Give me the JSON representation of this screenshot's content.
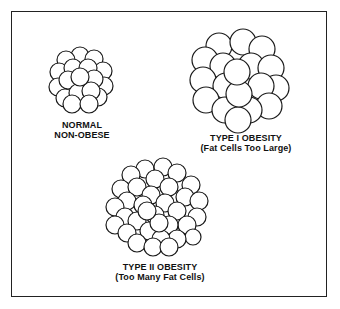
{
  "figure": {
    "panels": [
      {
        "id": "normal",
        "title": "NORMAL",
        "subtitle": "NON-OBESE",
        "cell_description": "small cluster of normal-size fat cells",
        "cell_radius": 9,
        "approx_cell_count": 22
      },
      {
        "id": "type1",
        "title": "TYPE I OBESITY",
        "subtitle": "(Fat Cells Too Large)",
        "cell_description": "cluster of enlarged fat cells",
        "cell_radius": 12.5,
        "approx_cell_count": 22
      },
      {
        "id": "type2",
        "title": "TYPE II OBESITY",
        "subtitle": "(Too Many Fat Cells)",
        "cell_description": "large cluster of many normal-size fat cells",
        "cell_radius": 9,
        "approx_cell_count": 55
      }
    ]
  },
  "colors": {
    "line": "#1a1a1a",
    "fill": "#ffffff",
    "background": "#ffffff"
  }
}
